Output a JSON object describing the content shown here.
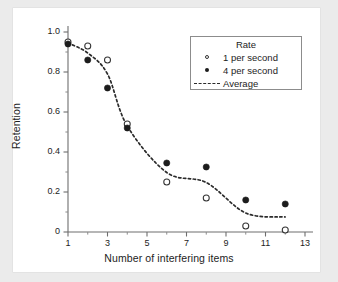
{
  "chart_data": {
    "type": "scatter",
    "title": "",
    "xlabel": "Number of interfering items",
    "ylabel": "Retention",
    "xlim": [
      1,
      13
    ],
    "ylim": [
      0,
      1.0
    ],
    "grid": false,
    "legend_position": "top-right",
    "legend_title": "Rate",
    "x_ticks": [
      "1",
      "3",
      "5",
      "7",
      "9",
      "11",
      "13"
    ],
    "x_tick_values": [
      1,
      3,
      5,
      7,
      9,
      11,
      13
    ],
    "x_minor_tick_values": [
      2,
      4,
      6,
      8,
      10,
      12
    ],
    "y_ticks": [
      "0",
      "0.2",
      "0.4",
      "0.6",
      "0.8",
      "1.0"
    ],
    "y_tick_values": [
      0,
      0.2,
      0.4,
      0.6,
      0.8,
      1.0
    ],
    "y_minor_tick_values": [
      0.1,
      0.3,
      0.5,
      0.7,
      0.9
    ],
    "series": [
      {
        "name": "1 per second",
        "marker": "open-circle",
        "x": [
          1,
          2,
          3,
          4,
          6,
          8,
          10,
          12
        ],
        "values": [
          0.95,
          0.93,
          0.86,
          0.54,
          0.25,
          0.17,
          0.03,
          0.01
        ]
      },
      {
        "name": "4 per second",
        "marker": "filled-circle",
        "x": [
          1,
          2,
          3,
          4,
          6,
          8,
          10,
          12
        ],
        "values": [
          0.94,
          0.86,
          0.72,
          0.52,
          0.345,
          0.325,
          0.16,
          0.14
        ]
      },
      {
        "name": "Average",
        "marker": "dashed-line",
        "x": [
          1,
          2,
          3,
          4,
          6,
          8,
          10,
          12
        ],
        "values": [
          0.945,
          0.895,
          0.79,
          0.53,
          0.2975,
          0.2475,
          0.095,
          0.075
        ]
      }
    ]
  },
  "legend": {
    "title": "Rate",
    "entries": [
      {
        "label": "1 per second",
        "marker": "open-circle"
      },
      {
        "label": "4 per second",
        "marker": "filled-circle"
      },
      {
        "label": "Average",
        "marker": "dashed-line"
      }
    ]
  },
  "colors": {
    "background": "#ebebeb",
    "panel": "#ffffff",
    "axis": "#6e6e6e",
    "marker_filled": "#1c1c1c",
    "marker_open_edge": "#333333",
    "average_line": "#2b2b2b",
    "text": "#1c1c1c"
  }
}
